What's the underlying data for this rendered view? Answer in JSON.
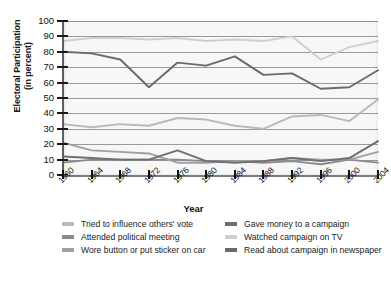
{
  "chart_data": {
    "type": "line",
    "title": "",
    "xlabel": "Year",
    "ylabel": "Electoral Participation (in percent)",
    "ylabel_lines": [
      "Electoral Participation",
      "(in percent)"
    ],
    "x": [
      1960,
      1964,
      1968,
      1972,
      1976,
      1980,
      1984,
      1988,
      1992,
      1996,
      2000,
      2004
    ],
    "categories": [
      "1960",
      "1964",
      "1968",
      "1972",
      "1976",
      "1980",
      "1984",
      "1988",
      "1992",
      "1996",
      "2000",
      "2004"
    ],
    "yticks": [
      0,
      10,
      20,
      30,
      40,
      50,
      60,
      70,
      80,
      90,
      100
    ],
    "ylim": [
      0,
      100
    ],
    "xlim": [
      1960,
      2004
    ],
    "grid": "horizontal",
    "legend_position": "below",
    "series": [
      {
        "name": "Tried to influence others' vote",
        "color": "#b9b9b9",
        "values": [
          33,
          31,
          33,
          32,
          37,
          36,
          32,
          30,
          38,
          39,
          35,
          49
        ]
      },
      {
        "name": "Attended political meeting",
        "color": "#8a8a8a",
        "values": [
          8,
          10,
          10,
          10,
          10,
          9,
          9,
          8,
          9,
          7,
          10,
          8
        ]
      },
      {
        "name": "Wore button or put sticker on car",
        "color": "#a0a0a0",
        "values": [
          21,
          16,
          15,
          14,
          8,
          8,
          9,
          9,
          11,
          10,
          10,
          15
        ]
      },
      {
        "name": "Gave money to a campaign",
        "color": "#707070",
        "values": [
          12,
          11,
          10,
          10,
          16,
          9,
          8,
          9,
          11,
          9,
          11,
          22
        ]
      },
      {
        "name": "Watched campaign on TV",
        "color": "#cfcfcf",
        "values": [
          87,
          89,
          89,
          88,
          89,
          87,
          88,
          87,
          90,
          75,
          83,
          87
        ]
      },
      {
        "name": "Read about campaign in newspaper",
        "color": "#6a6a6a",
        "values": [
          80,
          79,
          75,
          57,
          73,
          71,
          77,
          65,
          66,
          56,
          57,
          68
        ]
      }
    ]
  },
  "legend": {
    "left_items": [
      {
        "label": "Tried to influence others' vote",
        "color": "#b9b9b9"
      },
      {
        "label": "Attended political meeting",
        "color": "#8a8a8a"
      },
      {
        "label": "Wore button or put sticker on car",
        "color": "#a0a0a0"
      }
    ],
    "right_items": [
      {
        "label": "Gave money to a campaign",
        "color": "#707070"
      },
      {
        "label": "Watched campaign on TV",
        "color": "#cfcfcf"
      },
      {
        "label": "Read about campaign in newspaper",
        "color": "#6a6a6a"
      }
    ]
  }
}
